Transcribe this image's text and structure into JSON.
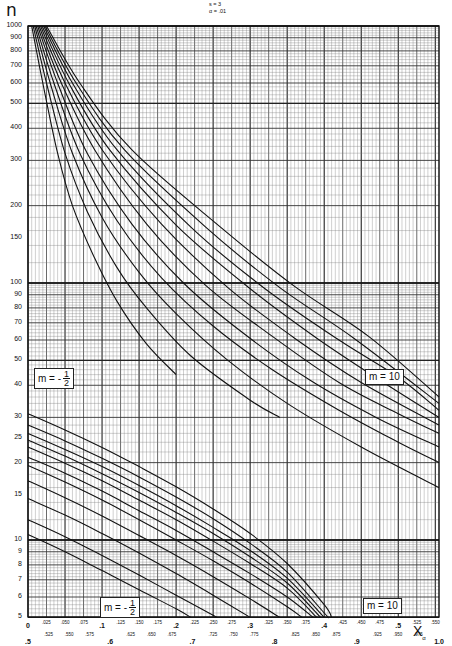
{
  "header": {
    "y_symbol": "n",
    "params": [
      "s = 3",
      "α = .01"
    ]
  },
  "axes": {
    "y_ticks": [
      "1000",
      "900",
      "800",
      "700",
      "600",
      "500",
      "400",
      "300",
      "200",
      "150",
      "100",
      "90",
      "80",
      "70",
      "60",
      "50",
      "40",
      "30",
      "25",
      "20",
      "15",
      "10",
      "9",
      "8",
      "7",
      "6",
      "5"
    ],
    "x_row1_minor": [
      ".025",
      ".050",
      ".075",
      ".125",
      ".150",
      ".175",
      ".225",
      ".250",
      ".275",
      ".325",
      ".350",
      ".375",
      ".425",
      ".450",
      ".475",
      ".525",
      ".550"
    ],
    "x_row1_major": [
      "0",
      ".1",
      ".2",
      ".3",
      ".4",
      ".5"
    ],
    "x_row2_minor": [
      ".525",
      ".550",
      ".575",
      ".625",
      ".650",
      ".675",
      ".725",
      ".750",
      ".775",
      ".825",
      ".850",
      ".875",
      ".925",
      ".950",
      ".975"
    ],
    "x_row2_major": [
      ".5",
      ".6",
      ".7",
      ".8",
      ".9",
      "1.0"
    ],
    "x_title": "X",
    "x_title_sub": "α"
  },
  "labels": {
    "upper_left": {
      "text": "m = -",
      "num": "1",
      "den": "2"
    },
    "upper_right": {
      "text": "m = 10"
    },
    "lower_left": {
      "text": "m = -",
      "num": "1",
      "den": "2"
    },
    "lower_right": {
      "text": "m = 10"
    }
  },
  "chart_data": {
    "type": "line",
    "xlabel": "X_α",
    "ylabel": "n",
    "x_scale": "linear",
    "y_scale": "log",
    "xlim": [
      0,
      0.555
    ],
    "xlim_secondary_row": [
      0.5,
      1.0
    ],
    "ylim": [
      5,
      1000
    ],
    "grid": true,
    "legend": "none (curves labelled m = -1/2 to m = 10 directly on chart)",
    "families": [
      {
        "name": "upper family (large n)",
        "curve_labels_ends": [
          "m = -1/2",
          "m = 10"
        ],
        "series": [
          {
            "name": "curve 1 (m=-1/2)",
            "points": [
              [
                0.005,
                1000
              ],
              [
                0.02,
                600
              ],
              [
                0.04,
                320
              ],
              [
                0.06,
                200
              ],
              [
                0.09,
                125
              ],
              [
                0.12,
                85
              ],
              [
                0.16,
                58
              ],
              [
                0.2,
                44
              ]
            ]
          },
          {
            "name": "curve 2",
            "points": [
              [
                0.007,
                1000
              ],
              [
                0.025,
                600
              ],
              [
                0.05,
                320
              ],
              [
                0.08,
                190
              ],
              [
                0.12,
                115
              ],
              [
                0.16,
                80
              ],
              [
                0.22,
                52
              ],
              [
                0.3,
                35
              ],
              [
                0.34,
                30
              ]
            ]
          },
          {
            "name": "curve 3",
            "points": [
              [
                0.009,
                1000
              ],
              [
                0.03,
                600
              ],
              [
                0.06,
                320
              ],
              [
                0.1,
                180
              ],
              [
                0.15,
                110
              ],
              [
                0.2,
                76
              ],
              [
                0.27,
                50
              ],
              [
                0.35,
                34
              ],
              [
                0.45,
                23
              ],
              [
                0.555,
                16
              ]
            ]
          },
          {
            "name": "curve 4",
            "points": [
              [
                0.011,
                1000
              ],
              [
                0.035,
                600
              ],
              [
                0.07,
                320
              ],
              [
                0.12,
                175
              ],
              [
                0.18,
                105
              ],
              [
                0.25,
                68
              ],
              [
                0.33,
                46
              ],
              [
                0.42,
                32
              ],
              [
                0.5,
                24
              ],
              [
                0.555,
                20
              ]
            ]
          },
          {
            "name": "curve 5",
            "points": [
              [
                0.013,
                1000
              ],
              [
                0.04,
                600
              ],
              [
                0.08,
                320
              ],
              [
                0.14,
                170
              ],
              [
                0.21,
                100
              ],
              [
                0.29,
                64
              ],
              [
                0.38,
                42
              ],
              [
                0.47,
                30
              ],
              [
                0.555,
                23
              ]
            ]
          },
          {
            "name": "curve 6",
            "points": [
              [
                0.015,
                1000
              ],
              [
                0.045,
                600
              ],
              [
                0.09,
                330
              ],
              [
                0.16,
                170
              ],
              [
                0.24,
                98
              ],
              [
                0.33,
                62
              ],
              [
                0.42,
                41
              ],
              [
                0.5,
                31
              ],
              [
                0.555,
                26
              ]
            ]
          },
          {
            "name": "curve 7",
            "points": [
              [
                0.017,
                1000
              ],
              [
                0.05,
                600
              ],
              [
                0.1,
                330
              ],
              [
                0.18,
                170
              ],
              [
                0.27,
                96
              ],
              [
                0.36,
                61
              ],
              [
                0.45,
                41
              ],
              [
                0.555,
                28
              ]
            ]
          },
          {
            "name": "curve 8",
            "points": [
              [
                0.019,
                1000
              ],
              [
                0.055,
                600
              ],
              [
                0.11,
                330
              ],
              [
                0.2,
                168
              ],
              [
                0.3,
                95
              ],
              [
                0.39,
                61
              ],
              [
                0.48,
                41
              ],
              [
                0.555,
                30
              ]
            ]
          },
          {
            "name": "curve 9",
            "points": [
              [
                0.021,
                1000
              ],
              [
                0.06,
                600
              ],
              [
                0.12,
                330
              ],
              [
                0.22,
                165
              ],
              [
                0.32,
                95
              ],
              [
                0.42,
                60
              ],
              [
                0.5,
                43
              ],
              [
                0.555,
                32
              ]
            ]
          },
          {
            "name": "curve 10",
            "points": [
              [
                0.023,
                1000
              ],
              [
                0.065,
                600
              ],
              [
                0.13,
                330
              ],
              [
                0.24,
                165
              ],
              [
                0.34,
                96
              ],
              [
                0.44,
                61
              ],
              [
                0.555,
                34
              ]
            ]
          },
          {
            "name": "curve 11 (m=10)",
            "points": [
              [
                0.025,
                1000
              ],
              [
                0.07,
                600
              ],
              [
                0.14,
                330
              ],
              [
                0.26,
                165
              ],
              [
                0.36,
                97
              ],
              [
                0.46,
                62
              ],
              [
                0.555,
                36
              ]
            ]
          }
        ]
      },
      {
        "name": "lower family (small n)",
        "curve_labels_ends": [
          "m = -1/2",
          "m = 10"
        ],
        "series": [
          {
            "name": "curve 1 (m=-1/2)",
            "points": [
              [
                0,
                10.5
              ],
              [
                0.05,
                9
              ],
              [
                0.1,
                7.6
              ],
              [
                0.15,
                6.4
              ],
              [
                0.2,
                5.4
              ],
              [
                0.22,
                5
              ]
            ]
          },
          {
            "name": "curve 2",
            "points": [
              [
                0,
                12
              ],
              [
                0.05,
                10.3
              ],
              [
                0.1,
                8.7
              ],
              [
                0.15,
                7.3
              ],
              [
                0.2,
                6.1
              ],
              [
                0.25,
                5.1
              ],
              [
                0.255,
                5
              ]
            ]
          },
          {
            "name": "curve 3",
            "points": [
              [
                0,
                14.5
              ],
              [
                0.05,
                12.5
              ],
              [
                0.1,
                10.6
              ],
              [
                0.15,
                8.9
              ],
              [
                0.2,
                7.4
              ],
              [
                0.25,
                6.1
              ],
              [
                0.3,
                5
              ]
            ]
          },
          {
            "name": "curve 4",
            "points": [
              [
                0,
                17
              ],
              [
                0.05,
                14.6
              ],
              [
                0.1,
                12.4
              ],
              [
                0.15,
                10.4
              ],
              [
                0.2,
                8.7
              ],
              [
                0.25,
                7.2
              ],
              [
                0.3,
                5.9
              ],
              [
                0.34,
                5
              ]
            ]
          },
          {
            "name": "curve 5",
            "points": [
              [
                0,
                19.5
              ],
              [
                0.05,
                16.8
              ],
              [
                0.1,
                14.3
              ],
              [
                0.15,
                12
              ],
              [
                0.2,
                10
              ],
              [
                0.25,
                8.3
              ],
              [
                0.3,
                6.8
              ],
              [
                0.35,
                5.5
              ],
              [
                0.37,
                5
              ]
            ]
          },
          {
            "name": "curve 6",
            "points": [
              [
                0,
                21
              ],
              [
                0.05,
                18.2
              ],
              [
                0.1,
                15.5
              ],
              [
                0.15,
                13
              ],
              [
                0.2,
                10.9
              ],
              [
                0.25,
                9
              ],
              [
                0.3,
                7.4
              ],
              [
                0.35,
                6
              ],
              [
                0.385,
                5
              ]
            ]
          },
          {
            "name": "curve 7",
            "points": [
              [
                0,
                23
              ],
              [
                0.05,
                19.9
              ],
              [
                0.1,
                17
              ],
              [
                0.15,
                14.3
              ],
              [
                0.2,
                12
              ],
              [
                0.25,
                9.9
              ],
              [
                0.3,
                8.1
              ],
              [
                0.35,
                6.5
              ],
              [
                0.39,
                5
              ]
            ]
          },
          {
            "name": "curve 8",
            "points": [
              [
                0,
                24.5
              ],
              [
                0.05,
                21.2
              ],
              [
                0.1,
                18.1
              ],
              [
                0.15,
                15.3
              ],
              [
                0.2,
                12.8
              ],
              [
                0.25,
                10.6
              ],
              [
                0.3,
                8.6
              ],
              [
                0.35,
                6.8
              ],
              [
                0.395,
                5
              ]
            ]
          },
          {
            "name": "curve 9",
            "points": [
              [
                0,
                26
              ],
              [
                0.05,
                22.5
              ],
              [
                0.1,
                19.3
              ],
              [
                0.15,
                16.3
              ],
              [
                0.2,
                13.6
              ],
              [
                0.25,
                11.2
              ],
              [
                0.3,
                9.1
              ],
              [
                0.35,
                7.1
              ],
              [
                0.4,
                5
              ]
            ]
          },
          {
            "name": "curve 10",
            "points": [
              [
                0,
                28
              ],
              [
                0.05,
                24.3
              ],
              [
                0.1,
                20.8
              ],
              [
                0.15,
                17.6
              ],
              [
                0.2,
                14.7
              ],
              [
                0.25,
                12.1
              ],
              [
                0.3,
                9.7
              ],
              [
                0.35,
                7.5
              ],
              [
                0.4,
                5.2
              ],
              [
                0.405,
                5
              ]
            ]
          },
          {
            "name": "curve 11 (m=10)",
            "points": [
              [
                0,
                31
              ],
              [
                0.05,
                26.8
              ],
              [
                0.1,
                22.9
              ],
              [
                0.15,
                19.3
              ],
              [
                0.2,
                16.1
              ],
              [
                0.25,
                13.2
              ],
              [
                0.3,
                10.6
              ],
              [
                0.35,
                8.1
              ],
              [
                0.4,
                5.6
              ],
              [
                0.41,
                5
              ]
            ]
          }
        ]
      }
    ]
  }
}
